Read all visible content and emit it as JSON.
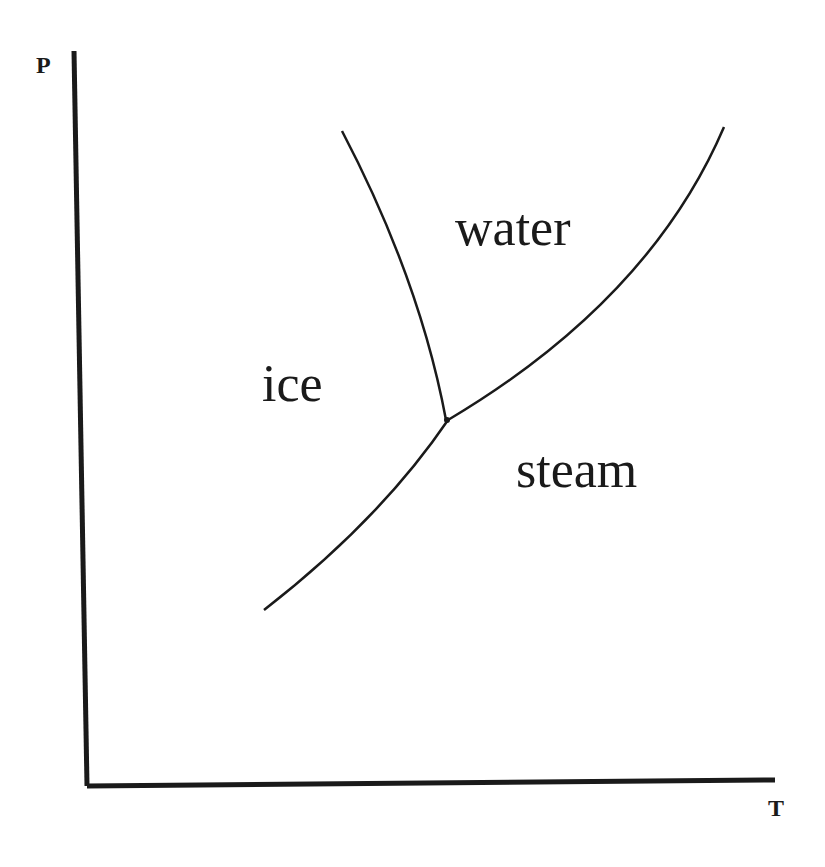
{
  "diagram": {
    "axes": {
      "y_label": "P",
      "x_label": "T"
    },
    "regions": {
      "ice": "ice",
      "water": "water",
      "steam": "steam"
    },
    "curves": [
      {
        "name": "melting-curve",
        "between": [
          "ice",
          "water"
        ]
      },
      {
        "name": "vaporization-curve",
        "between": [
          "water",
          "steam"
        ]
      },
      {
        "name": "sublimation-curve",
        "between": [
          "ice",
          "steam"
        ]
      }
    ],
    "point": {
      "name": "triple-point"
    },
    "colors": {
      "line": "#1a1a1a",
      "background": "#ffffff"
    }
  }
}
